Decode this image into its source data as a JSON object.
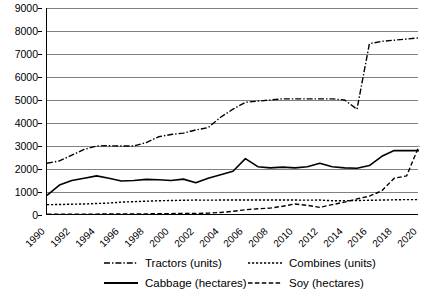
{
  "chart_data": {
    "type": "line",
    "title": "",
    "subtitle": "",
    "xlabel": "",
    "ylabel": "",
    "grid": true,
    "legend_position": "bottom",
    "ylim": [
      0,
      9000
    ],
    "ytick_labels": [
      "9000",
      "8000",
      "7000",
      "6000",
      "5000",
      "4000",
      "3000",
      "2000",
      "1000",
      "0"
    ],
    "yticks": [
      9000,
      8000,
      7000,
      6000,
      5000,
      4000,
      3000,
      2000,
      1000,
      0
    ],
    "xlim": [
      1990,
      2020
    ],
    "xtick_labels": [
      "1990",
      "1992",
      "1994",
      "1996",
      "1998",
      "2000",
      "2002",
      "2004",
      "2006",
      "2008",
      "2010",
      "2012",
      "2014",
      "2016",
      "2018",
      "2020"
    ],
    "x": [
      1990,
      1991,
      1992,
      1993,
      1994,
      1995,
      1996,
      1997,
      1998,
      1999,
      2000,
      2001,
      2002,
      2003,
      2004,
      2005,
      2006,
      2007,
      2008,
      2009,
      2010,
      2011,
      2012,
      2013,
      2014,
      2015,
      2016,
      2017,
      2018,
      2019,
      2020
    ],
    "series": [
      {
        "name": "Tractors (units)",
        "unit": "units",
        "style": "dash-dot",
        "color": "#000000",
        "values": [
          2250,
          2350,
          2600,
          2850,
          3000,
          3010,
          3000,
          3000,
          3150,
          3400,
          3500,
          3560,
          3700,
          3800,
          4250,
          4600,
          4900,
          4950,
          5000,
          5050,
          5050,
          5050,
          5050,
          5050,
          5000,
          4600,
          7450,
          7550,
          7600,
          7650,
          7700
        ]
      },
      {
        "name": "Combines (units)",
        "unit": "units",
        "style": "dotted",
        "color": "#000000",
        "values": [
          450,
          455,
          470,
          480,
          500,
          520,
          560,
          580,
          600,
          620,
          630,
          640,
          650,
          645,
          650,
          650,
          655,
          650,
          650,
          650,
          650,
          645,
          650,
          620,
          620,
          630,
          640,
          650,
          660,
          670,
          670
        ]
      },
      {
        "name": "Cabbage (hectares)",
        "unit": "hectares",
        "style": "solid",
        "color": "#000000",
        "values": [
          850,
          1300,
          1500,
          1600,
          1700,
          1600,
          1480,
          1500,
          1550,
          1530,
          1500,
          1560,
          1400,
          1600,
          1750,
          1900,
          2450,
          2100,
          2050,
          2080,
          2050,
          2100,
          2250,
          2100,
          2050,
          2030,
          2150,
          2550,
          2800,
          2800,
          2800
        ]
      },
      {
        "name": "Soy (hectares)",
        "unit": "hectares",
        "style": "dashed",
        "color": "#000000",
        "values": [
          30,
          32,
          35,
          38,
          40,
          42,
          45,
          48,
          50,
          55,
          60,
          65,
          70,
          80,
          110,
          160,
          230,
          270,
          300,
          380,
          480,
          420,
          330,
          450,
          560,
          700,
          820,
          1050,
          1600,
          1700,
          3000
        ]
      }
    ]
  },
  "legend": {
    "items": [
      {
        "label": "Tractors (units)",
        "style": "dash-dot"
      },
      {
        "label": "Combines (units)",
        "style": "dotted"
      },
      {
        "label": "Cabbage (hectares)",
        "style": "solid"
      },
      {
        "label": "Soy (hectares)",
        "style": "dashed"
      }
    ]
  }
}
